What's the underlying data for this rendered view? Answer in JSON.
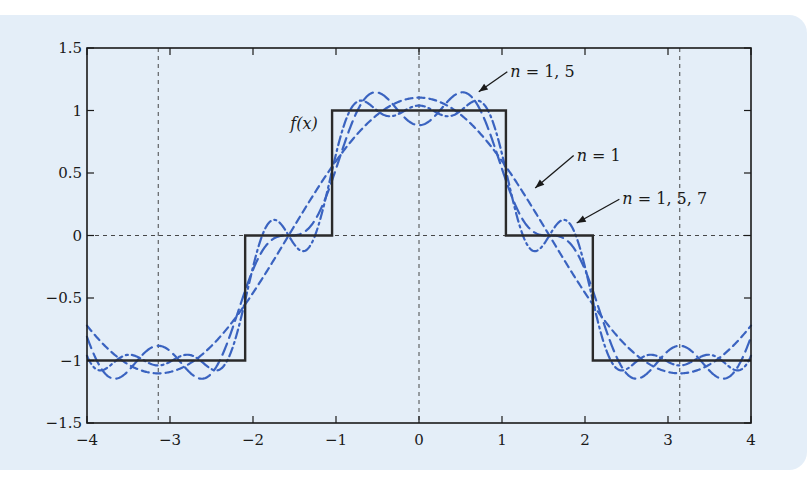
{
  "chart_data": {
    "type": "line",
    "title": "",
    "xlabel": "",
    "ylabel": "",
    "xlim": [
      -4,
      4
    ],
    "ylim": [
      -1.5,
      1.5
    ],
    "grid": "dashed reference lines at x = -pi, 0, pi and y = 0",
    "legend": "none; curves identified by arrow annotations",
    "xticks": [
      -4,
      -3,
      -2,
      -1,
      0,
      1,
      2,
      3,
      4
    ],
    "xtick_labels": [
      "−4",
      "−3",
      "−2",
      "−1",
      "0",
      "1",
      "2",
      "3",
      "4"
    ],
    "yticks": [
      1.5,
      1,
      0.5,
      0,
      -0.5,
      -1,
      -1.5
    ],
    "ytick_labels": [
      "1.5",
      "1",
      "0.5",
      "0",
      "−0.5",
      "−1",
      "−1.5"
    ],
    "reference_lines": {
      "vertical_x": [
        -3.14159,
        0,
        3.14159
      ],
      "horizontal_y": [
        0
      ]
    },
    "series": [
      {
        "name": "f(x)",
        "style": "solid",
        "color": "#2a2a2a",
        "description": "even step function: 1 for |x|<π/3, 0 for π/3<|x|<2π/3, -1 for 2π/3<|x|<π",
        "x": [
          -4,
          -2.0944,
          -2.0944,
          -1.0472,
          -1.0472,
          1.0472,
          1.0472,
          2.0944,
          2.0944,
          4
        ],
        "y": [
          -1,
          -1,
          0,
          0,
          1,
          1,
          0,
          0,
          -1,
          -1
        ]
      },
      {
        "name": "n = 1",
        "style": "dashed",
        "color": "#3a63c0",
        "terms": [
          [
            1,
            1.1027
          ]
        ]
      },
      {
        "name": "n = 1, 5",
        "style": "long-dashed",
        "color": "#3a63c0",
        "terms": [
          [
            1,
            1.1027
          ],
          [
            5,
            -0.2205
          ]
        ]
      },
      {
        "name": "n = 1, 5, 7",
        "style": "dash-dot",
        "color": "#3a63c0",
        "terms": [
          [
            1,
            1.1027
          ],
          [
            5,
            -0.2205
          ],
          [
            7,
            0.1575
          ]
        ]
      }
    ],
    "annotations": [
      {
        "text": "f(x)",
        "x": -1.55,
        "y": 0.85,
        "arrow": false
      },
      {
        "text_var": "n",
        "text_rest": " = 1, 5",
        "x": 1.1,
        "y": 1.27,
        "arrow_to": [
          0.72,
          1.15
        ]
      },
      {
        "text_var": "n",
        "text_rest": " = 1",
        "x": 1.9,
        "y": 0.6,
        "arrow_to": [
          1.4,
          0.38
        ]
      },
      {
        "text_var": "n",
        "text_rest": " = 1, 5, 7",
        "x": 2.45,
        "y": 0.25,
        "arrow_to": [
          1.9,
          0.1
        ]
      }
    ]
  },
  "colors": {
    "panel_background": "#e4eef8",
    "curve_blue": "#3a63c0",
    "step_line": "#2a2a2a",
    "axis": "#1a1a1a"
  }
}
